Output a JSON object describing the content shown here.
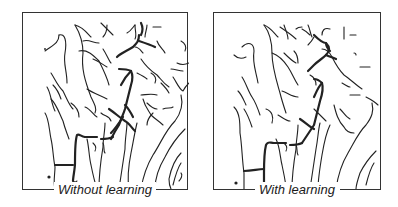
{
  "figure": {
    "panels": [
      {
        "id": "without",
        "caption": "Without learning"
      },
      {
        "id": "with",
        "caption": "With learning"
      }
    ],
    "colors": {
      "line": "#222222",
      "background": "#ffffff",
      "frame": "#333333"
    }
  }
}
